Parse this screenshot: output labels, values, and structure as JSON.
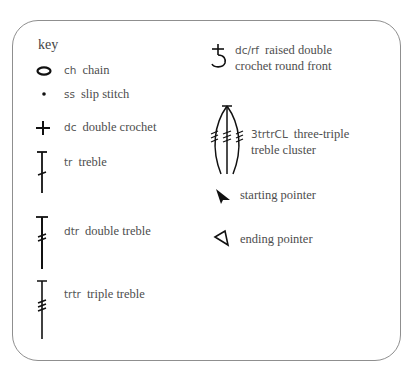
{
  "title": "key",
  "items": [
    {
      "icon": "chain-oval-icon",
      "abbr": "ch",
      "label": "chain"
    },
    {
      "icon": "slip-stitch-dot-icon",
      "abbr": "ss",
      "label": "slip stitch"
    },
    {
      "icon": "double-crochet-plus-icon",
      "abbr": "dc",
      "label": "double crochet"
    },
    {
      "icon": "treble-icon",
      "abbr": "tr",
      "label": "treble"
    },
    {
      "icon": "double-treble-icon",
      "abbr": "dtr",
      "label": "double treble"
    },
    {
      "icon": "triple-treble-icon",
      "abbr": "trtr",
      "label": "triple treble"
    },
    {
      "icon": "raised-double-crochet-icon",
      "abbr": "dc/rf",
      "label": "raised double",
      "label2": "crochet round front"
    },
    {
      "icon": "three-triple-treble-cluster-icon",
      "abbr": "3trtrCL",
      "label": "three-triple",
      "label2": "treble cluster"
    },
    {
      "icon": "starting-pointer-icon",
      "abbr": "",
      "label": "starting pointer"
    },
    {
      "icon": "ending-pointer-icon",
      "abbr": "",
      "label": "ending pointer"
    }
  ]
}
